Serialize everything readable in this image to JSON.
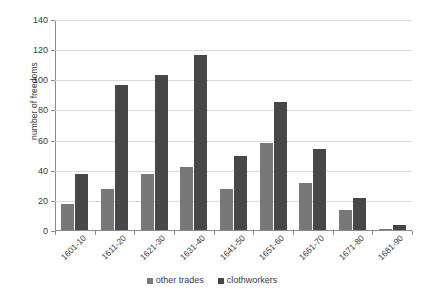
{
  "chart_data": {
    "type": "bar",
    "title": "",
    "xlabel": "",
    "ylabel": "number of freedoms",
    "ylim": [
      0,
      140
    ],
    "ytick_step": 20,
    "yticks": [
      0,
      20,
      40,
      60,
      80,
      100,
      120,
      140
    ],
    "grid": true,
    "legend_position": "bottom",
    "categories": [
      "1601-10",
      "1611-20",
      "1621-30",
      "1631-40",
      "1641-50",
      "1651-60",
      "1661-70",
      "1671-80",
      "1681-90"
    ],
    "series": [
      {
        "name": "other trades",
        "color": "#787878",
        "values": [
          17,
          27,
          37,
          42,
          27,
          58,
          31,
          13,
          1
        ]
      },
      {
        "name": "clothworkers",
        "color": "#474747",
        "values": [
          37,
          96,
          103,
          116,
          49,
          85,
          54,
          21,
          3
        ]
      }
    ]
  },
  "legend": {
    "items": [
      {
        "label": "other trades"
      },
      {
        "label": "clothworkers"
      }
    ]
  }
}
